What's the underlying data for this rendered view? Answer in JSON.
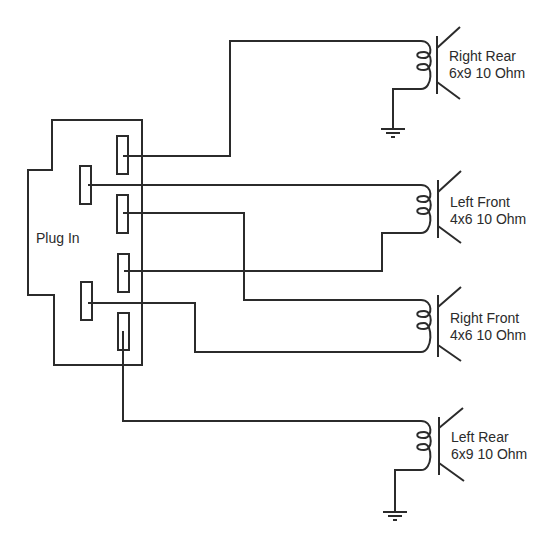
{
  "diagram": {
    "type": "wiring-schematic",
    "connector": {
      "label": "Plug In",
      "pins": [
        "pin-1",
        "pin-2",
        "pin-3",
        "pin-4",
        "pin-5",
        "pin-6"
      ]
    },
    "speakers": [
      {
        "id": "right-rear",
        "name": "Right Rear",
        "spec": "6x9 10 Ohm",
        "grounded": true
      },
      {
        "id": "left-front",
        "name": "Left Front",
        "spec": "4x6 10 Ohm",
        "grounded": false
      },
      {
        "id": "right-front",
        "name": "Right Front",
        "spec": "4x6 10 Ohm",
        "grounded": false
      },
      {
        "id": "left-rear",
        "name": "Left Rear",
        "spec": "6x9 10 Ohm",
        "grounded": true
      }
    ],
    "connections": [
      {
        "pin": "pin-1",
        "to": "right-rear",
        "terminal": "+"
      },
      {
        "pin": "pin-2",
        "to": "left-front",
        "terminal": "+"
      },
      {
        "pin": "pin-3",
        "to": "right-front",
        "terminal": "+"
      },
      {
        "pin": "pin-4",
        "to": "left-front",
        "terminal": "-"
      },
      {
        "pin": "pin-5",
        "to": "right-front",
        "terminal": "-"
      },
      {
        "pin": "pin-6",
        "to": "left-rear",
        "terminal": "+"
      },
      {
        "from": "right-rear",
        "terminal": "-",
        "to": "ground"
      },
      {
        "from": "left-rear",
        "terminal": "-",
        "to": "ground"
      }
    ],
    "colors": {
      "line": "#2b2b2b",
      "background": "#ffffff"
    }
  }
}
